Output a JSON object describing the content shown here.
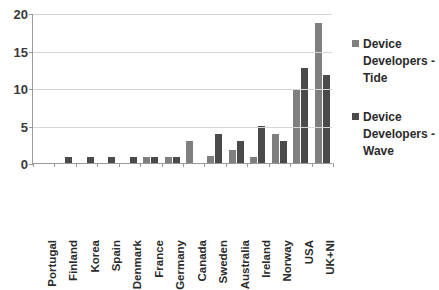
{
  "chart_data": {
    "type": "bar",
    "title": "",
    "subtitle": "",
    "xlabel": "",
    "ylabel": "",
    "ylim": [
      0,
      20
    ],
    "yticks": [
      0,
      5,
      10,
      15,
      20
    ],
    "grid": true,
    "legend_position": "right",
    "categories": [
      "Portugal",
      "Finland",
      "Korea",
      "Spain",
      "Denmark",
      "France",
      "Germany",
      "Canada",
      "Sweden",
      "Australia",
      "Ireland",
      "Norway",
      "USA",
      "UK+NI"
    ],
    "series": [
      {
        "name": "Device Developers - Tide",
        "color": "#7f7f7f",
        "values": [
          0,
          0,
          0,
          0,
          0,
          0.8,
          0.8,
          2.9,
          0.9,
          1.8,
          0.8,
          3.9,
          9.8,
          18.7
        ]
      },
      {
        "name": "Device Developers - Wave",
        "color": "#4a4a4a",
        "values": [
          0,
          0.8,
          0.8,
          0.8,
          0.8,
          0.8,
          0.8,
          0,
          3.9,
          2.9,
          4.9,
          2.9,
          12.7,
          11.7
        ]
      }
    ]
  },
  "legend": {
    "entries": [
      {
        "label": "Device Developers - Tide",
        "color": "#7f7f7f"
      },
      {
        "label": "Device Developers - Wave",
        "color": "#4a4a4a"
      }
    ]
  },
  "axis": {
    "y_tick_labels": [
      "20",
      "15",
      "10",
      "5",
      "0"
    ]
  }
}
